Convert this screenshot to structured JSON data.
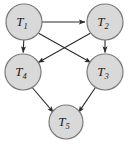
{
  "figure": {
    "kind": "directed-acyclic-graph",
    "width": 132,
    "height": 146,
    "background_color": "#ffffff",
    "node_fill_color": "#d9d9d9",
    "node_stroke_color": "#7a7a7a",
    "edge_color": "#2b2b2b",
    "label_color": "#1a1a1a"
  },
  "nodes": [
    {
      "id": "T1",
      "base": "T",
      "subscript": "1",
      "label": "T1",
      "cx": 24,
      "cy": 22,
      "r": 18
    },
    {
      "id": "T2",
      "base": "T",
      "subscript": "2",
      "label": "T2",
      "cx": 105,
      "cy": 22,
      "r": 18
    },
    {
      "id": "T3",
      "base": "T",
      "subscript": "3",
      "label": "T3",
      "cx": 105,
      "cy": 72,
      "r": 18
    },
    {
      "id": "T4",
      "base": "T",
      "subscript": "4",
      "label": "T4",
      "cx": 23,
      "cy": 72,
      "r": 18
    },
    {
      "id": "T5",
      "base": "T",
      "subscript": "5",
      "label": "T5",
      "cx": 66,
      "cy": 122,
      "r": 17
    }
  ],
  "edges": [
    {
      "id": "edge-t1-t2",
      "from": "T1",
      "to": "T2",
      "arrow": "to"
    },
    {
      "id": "edge-t1-t4",
      "from": "T1",
      "to": "T4",
      "arrow": "to"
    },
    {
      "id": "edge-t1-t3",
      "from": "T1",
      "to": "T3",
      "arrow": "to"
    },
    {
      "id": "edge-t2-t4",
      "from": "T2",
      "to": "T4",
      "arrow": "to"
    },
    {
      "id": "edge-t2-t3",
      "from": "T2",
      "to": "T3",
      "arrow": "to"
    },
    {
      "id": "edge-t4-t5",
      "from": "T4",
      "to": "T5",
      "arrow": "to"
    },
    {
      "id": "edge-t3-t5",
      "from": "T3",
      "to": "T5",
      "arrow": "to"
    }
  ]
}
